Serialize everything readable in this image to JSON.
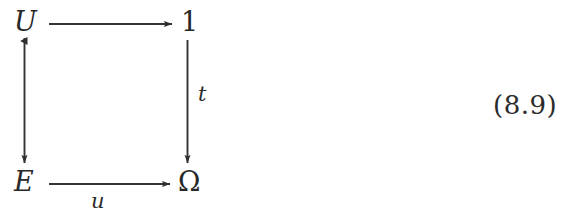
{
  "document": {
    "kind": "commutative-diagram",
    "equation_number": "(8.9)"
  },
  "diagram": {
    "nodes": [
      {
        "id": "U",
        "label": "U",
        "style": "italic",
        "position": "top-left"
      },
      {
        "id": "one",
        "label": "1",
        "style": "upright",
        "position": "top-right"
      },
      {
        "id": "E",
        "label": "E",
        "style": "italic",
        "position": "bottom-left"
      },
      {
        "id": "Omega",
        "label": "Ω",
        "style": "upright",
        "position": "bottom-right"
      }
    ],
    "arrows": [
      {
        "id": "top",
        "from": "U",
        "to": "one",
        "direction": "right",
        "label": "",
        "head": "standard",
        "tail": "none"
      },
      {
        "id": "left",
        "from": "U",
        "to": "E",
        "direction": "down",
        "label": "",
        "head": "standard",
        "tail": "triangle-marker"
      },
      {
        "id": "right",
        "from": "one",
        "to": "Omega",
        "direction": "down",
        "label": "t",
        "label_position": "right-of-arrow",
        "head": "standard",
        "tail": "none"
      },
      {
        "id": "bottom",
        "from": "E",
        "to": "Omega",
        "direction": "right",
        "label": "u",
        "label_position": "below-arrow",
        "head": "standard",
        "tail": "none"
      }
    ],
    "colors": {
      "ink": "#282828",
      "background": "#ffffff",
      "stroke": "#333333"
    }
  }
}
